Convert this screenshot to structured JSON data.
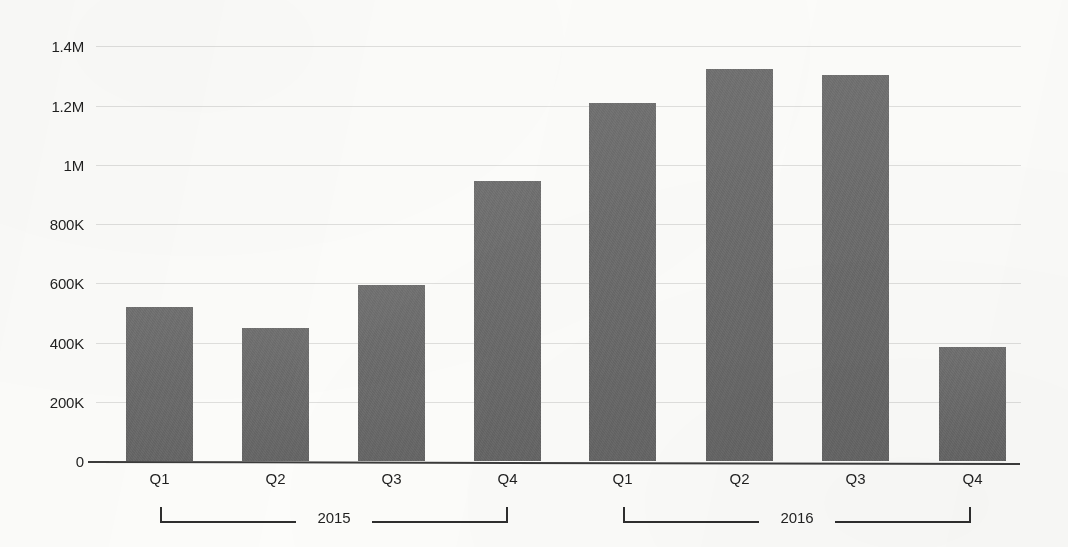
{
  "chart_data": {
    "type": "bar",
    "title": "",
    "subtitle": "",
    "xlabel": "",
    "ylabel": "",
    "categories": [
      "Q1",
      "Q2",
      "Q3",
      "Q4",
      "Q1",
      "Q2",
      "Q3",
      "Q4"
    ],
    "groups": [
      {
        "label": "2015",
        "categories": [
          "Q1",
          "Q2",
          "Q3",
          "Q4"
        ],
        "values": [
          520000,
          450000,
          595000,
          945000
        ]
      },
      {
        "label": "2016",
        "categories": [
          "Q1",
          "Q2",
          "Q3",
          "Q4"
        ],
        "values": [
          1210000,
          1325000,
          1305000,
          385000
        ]
      }
    ],
    "values": [
      520000,
      450000,
      595000,
      945000,
      1210000,
      1325000,
      1305000,
      385000
    ],
    "ylim": [
      0,
      1400000
    ],
    "ytick_values": [
      1400000,
      1200000,
      1000000,
      800000,
      600000,
      400000,
      200000,
      0
    ],
    "ytick_labels": [
      "1.4M",
      "1.2M",
      "1M",
      "800K",
      "600K",
      "400K",
      "200K",
      "0"
    ],
    "grid": true,
    "legend": false,
    "legend_position": "none",
    "bar_color": "#6a6a6a",
    "gridline_color": "#dfdfdd",
    "axis_color": "#3b3b3b",
    "background_color": "#fcfcfa"
  },
  "bars": [
    {
      "name": "bar-2015-q1",
      "label": "Q1",
      "year": "2015",
      "value": 520000,
      "left": 126,
      "width": 67
    },
    {
      "name": "bar-2015-q2",
      "label": "Q2",
      "year": "2015",
      "value": 450000,
      "left": 242,
      "width": 67
    },
    {
      "name": "bar-2015-q3",
      "label": "Q3",
      "year": "2015",
      "value": 595000,
      "left": 358,
      "width": 67
    },
    {
      "name": "bar-2015-q4",
      "label": "Q4",
      "year": "2015",
      "value": 945000,
      "left": 474,
      "width": 67
    },
    {
      "name": "bar-2016-q1",
      "label": "Q1",
      "year": "2016",
      "value": 1210000,
      "left": 589,
      "width": 67
    },
    {
      "name": "bar-2016-q2",
      "label": "Q2",
      "year": "2016",
      "value": 1325000,
      "left": 706,
      "width": 67
    },
    {
      "name": "bar-2016-q3",
      "label": "Q3",
      "year": "2016",
      "value": 1305000,
      "left": 822,
      "width": 67
    },
    {
      "name": "bar-2016-q4",
      "label": "Q4",
      "year": "2016",
      "value": 385000,
      "left": 939,
      "width": 67
    }
  ],
  "year_brackets": [
    {
      "label": "2015",
      "left": 160,
      "right": 508
    },
    {
      "label": "2016",
      "left": 623,
      "right": 971
    }
  ],
  "axis": {
    "zero_y": 461,
    "px_per_unit": 0.0002961,
    "plot_left": 96,
    "plot_right": 1021
  }
}
